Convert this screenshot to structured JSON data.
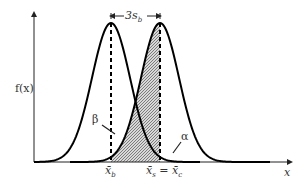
{
  "diagram": {
    "ylabel": "f(x)",
    "xlabel": "x",
    "separation_label": "3s",
    "separation_sub": "b",
    "beta_label": "β",
    "alpha_label": "α",
    "mean_blank_label": "x̄",
    "mean_blank_sub": "b",
    "mean_sample_label_1": "x̄",
    "mean_sample_sub_1": "s",
    "equals": " = ",
    "mean_sample_label_2": "x̄",
    "mean_sample_sub_2": "c"
  },
  "colors": {
    "curve": "#000000",
    "axis": "#222222",
    "hatch": "#555555",
    "text": "#333333"
  }
}
